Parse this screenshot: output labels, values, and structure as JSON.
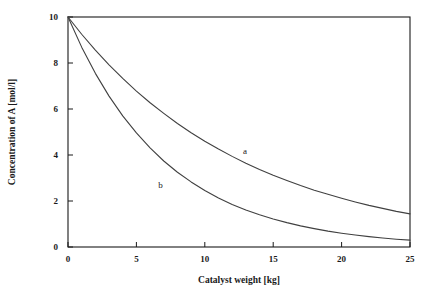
{
  "chart_data": {
    "type": "line",
    "title": "",
    "xlabel": "Catalyst weight [kg]",
    "ylabel": "Concentration of A [mol/l]",
    "xlim": [
      0,
      25
    ],
    "ylim": [
      0,
      10
    ],
    "xticks": [
      0,
      5,
      10,
      15,
      20,
      25
    ],
    "yticks": [
      0,
      2,
      4,
      6,
      8,
      10
    ],
    "xtick_labels": [
      "0",
      "5",
      "10",
      "15",
      "20",
      "25"
    ],
    "ytick_labels": [
      "0",
      "2",
      "4",
      "6",
      "8",
      "10"
    ],
    "grid": false,
    "legend_position": "inline-annotation",
    "series": [
      {
        "name": "a",
        "label": "a",
        "annotation_x": 12.8,
        "annotation_y": 4.35,
        "x": [
          0,
          1,
          2,
          3,
          4,
          5,
          6,
          7,
          8,
          9,
          10,
          11,
          12,
          13,
          14,
          15,
          16,
          17,
          18,
          19,
          20,
          21,
          22,
          23,
          24,
          25
        ],
        "y": [
          10.0,
          9.25,
          8.56,
          7.92,
          7.33,
          6.78,
          6.27,
          5.81,
          5.37,
          4.97,
          4.6,
          4.26,
          3.94,
          3.64,
          3.37,
          3.12,
          2.89,
          2.67,
          2.47,
          2.29,
          2.12,
          1.96,
          1.81,
          1.68,
          1.55,
          1.44
        ]
      },
      {
        "name": "b",
        "label": "b",
        "annotation_x": 6.6,
        "annotation_y": 2.85,
        "x": [
          0,
          1,
          2,
          3,
          4,
          5,
          6,
          7,
          8,
          9,
          10,
          11,
          12,
          13,
          14,
          15,
          16,
          17,
          18,
          19,
          20,
          21,
          22,
          23,
          24,
          25
        ],
        "y": [
          10.0,
          8.69,
          7.55,
          6.56,
          5.7,
          4.96,
          4.31,
          3.74,
          3.25,
          2.83,
          2.46,
          2.13,
          1.85,
          1.61,
          1.4,
          1.22,
          1.06,
          0.92,
          0.8,
          0.69,
          0.6,
          0.52,
          0.45,
          0.39,
          0.34,
          0.3
        ]
      }
    ],
    "colors": {
      "curve": "#404040",
      "axis": "#1a1a1a",
      "background": "#ffffff",
      "text": "#1a1a1a"
    }
  }
}
